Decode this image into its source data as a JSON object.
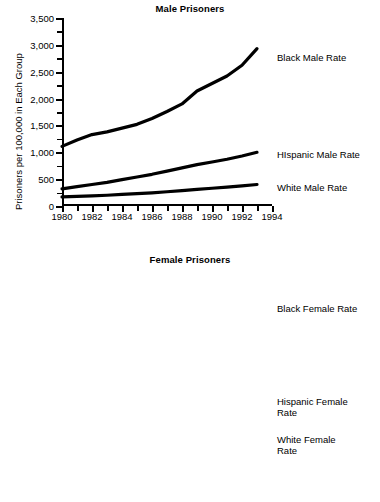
{
  "figure": {
    "ylabel": "Prisoners  per 100,000 in Each Group"
  },
  "charts": [
    {
      "id": "male",
      "title": "Male Prisoners",
      "labels": {
        "black": "Black Male Rate",
        "hispanic": "HIspanic Male Rate",
        "white": "White Male Rate"
      }
    },
    {
      "id": "female",
      "title": "Female Prisoners",
      "labels": {
        "black": "Black Female Rate",
        "hispanic": "Hispanic Female\nRate",
        "white": "White Female\nRate"
      }
    }
  ],
  "chart_data": [
    {
      "type": "line",
      "title": "Male Prisoners",
      "xlabel": "",
      "ylabel": "Prisoners  per 100,000 in Each Group",
      "xlim": [
        1980,
        1994
      ],
      "ylim": [
        0,
        3500
      ],
      "xticks": [
        1980,
        1982,
        1984,
        1986,
        1988,
        1990,
        1992,
        1994
      ],
      "xticklabels": [
        "1980",
        "1982",
        "1984",
        "1986",
        "1988",
        "1990",
        "1992",
        "1994"
      ],
      "xminorticks": [
        1981,
        1983,
        1985,
        1987,
        1989,
        1991,
        1993
      ],
      "yticks": [
        0,
        500,
        1000,
        1500,
        2000,
        2500,
        3000,
        3500
      ],
      "yticklabels": [
        "0",
        "500",
        "1,000",
        "1,500",
        "2,000",
        "2,500",
        "3,000",
        "3,500"
      ],
      "yminorticks": [
        250,
        750,
        1250,
        1750,
        2250,
        2750,
        3250
      ],
      "grid": false,
      "legend_position": "inline-right",
      "x": [
        1980,
        1981,
        1982,
        1983,
        1984,
        1985,
        1986,
        1987,
        1988,
        1989,
        1990,
        1991,
        1992,
        1993
      ],
      "series": [
        {
          "name": "Black Male Rate",
          "values": [
            1110,
            1230,
            1330,
            1380,
            1450,
            1520,
            1630,
            1760,
            1900,
            2140,
            2280,
            2420,
            2620,
            2930
          ]
        },
        {
          "name": "HIspanic Male Rate",
          "values": [
            320,
            360,
            400,
            440,
            490,
            540,
            590,
            650,
            710,
            770,
            820,
            870,
            930,
            1000
          ]
        },
        {
          "name": "White Male Rate",
          "values": [
            170,
            180,
            190,
            200,
            215,
            230,
            245,
            265,
            285,
            310,
            330,
            350,
            375,
            400
          ]
        }
      ]
    },
    {
      "type": "line",
      "title": "Female Prisoners",
      "xlabel": "",
      "ylabel": "Prisoners  per 100,000 in Each Group",
      "xlim": [
        1980,
        1994
      ],
      "ylim": [
        0,
        200
      ],
      "xticks": [
        1980,
        1982,
        1984,
        1986,
        1988,
        1990,
        1992,
        1994
      ],
      "xticklabels": [
        "1980",
        "1982",
        "1984",
        "1986",
        "1988",
        "1990",
        "1992",
        "1994"
      ],
      "xminorticks": [
        1981,
        1983,
        1985,
        1987,
        1989,
        1991,
        1993
      ],
      "yticks": [
        0,
        50,
        100,
        150,
        200
      ],
      "yticklabels": [
        "0",
        "50",
        "100",
        "150",
        "200"
      ],
      "yminorticks": [
        25,
        75,
        125,
        175
      ],
      "grid": false,
      "legend_position": "inline-right",
      "x": [
        1980,
        1981,
        1982,
        1983,
        1984,
        1985,
        1986,
        1987,
        1988,
        1989,
        1990,
        1991,
        1992,
        1993
      ],
      "series": [
        {
          "name": "Black Female Rate",
          "values": [
            44,
            50,
            55,
            60,
            65,
            70,
            75,
            80,
            89,
            115,
            124,
            133,
            141,
            165
          ]
        },
        {
          "name": "Hispanic Female Rate",
          "values": [
            9,
            11,
            14,
            17,
            20,
            23,
            27,
            31,
            35,
            39,
            42,
            43,
            45,
            50
          ]
        },
        {
          "name": "White Female Rate",
          "values": [
            6,
            7,
            8,
            9,
            10,
            11,
            12,
            14,
            15,
            17,
            19,
            20,
            21,
            23
          ]
        }
      ]
    }
  ]
}
